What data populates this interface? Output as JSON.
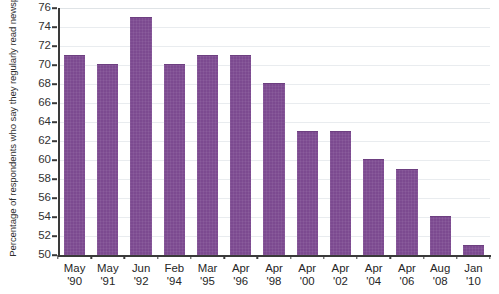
{
  "chart_data": {
    "type": "bar",
    "title": "",
    "subtitle": "",
    "xlabel": "",
    "ylabel": "Percentage of respondents who say they regularly read newspaper",
    "ylim": [
      50,
      76
    ],
    "ytick_step": 2,
    "yticks": [
      50,
      52,
      54,
      56,
      58,
      60,
      62,
      64,
      66,
      68,
      70,
      72,
      74,
      76
    ],
    "ytick_labels": [
      "50",
      "52",
      "54",
      "56",
      "58",
      "60",
      "62",
      "64",
      "66",
      "68",
      "70",
      "72",
      "74",
      "76"
    ],
    "grid": true,
    "grid_axis": "y",
    "legend": false,
    "legend_position": "none",
    "bar_color": "#7c4a90",
    "categories": [
      "May '90",
      "May '91",
      "Jun '92",
      "Feb '94",
      "Mar '95",
      "Apr '96",
      "Apr '98",
      "Apr '00",
      "Apr '02",
      "Apr '04",
      "Apr '06",
      "Aug '08",
      "Jan '10"
    ],
    "category_lines": [
      {
        "month": "May",
        "year": "'90"
      },
      {
        "month": "May",
        "year": "'91"
      },
      {
        "month": "Jun",
        "year": "'92"
      },
      {
        "month": "Feb",
        "year": "'94"
      },
      {
        "month": "Mar",
        "year": "'95"
      },
      {
        "month": "Apr",
        "year": "'96"
      },
      {
        "month": "Apr",
        "year": "'98"
      },
      {
        "month": "Apr",
        "year": "'00"
      },
      {
        "month": "Apr",
        "year": "'02"
      },
      {
        "month": "Apr",
        "year": "'04"
      },
      {
        "month": "Apr",
        "year": "'06"
      },
      {
        "month": "Aug",
        "year": "'08"
      },
      {
        "month": "Jan",
        "year": "'10"
      }
    ],
    "values": [
      71,
      70,
      75,
      70,
      71,
      71,
      68,
      63,
      63,
      60,
      59,
      54,
      51
    ]
  }
}
